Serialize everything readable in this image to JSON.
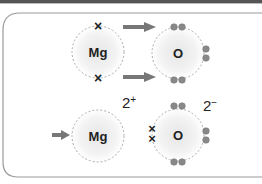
{
  "diagram": {
    "before": {
      "metal_atom": {
        "symbol": "Mg",
        "outer_electrons": 2,
        "electron_marker": "cross"
      },
      "nonmetal_atom": {
        "symbol": "O",
        "outer_electrons": 6,
        "electron_marker": "dot"
      },
      "arrows": 2
    },
    "after": {
      "metal_ion": {
        "symbol": "Mg",
        "charge": "2+",
        "outer_electrons": 0
      },
      "nonmetal_ion": {
        "symbol": "O",
        "charge": "2−",
        "outer_electrons": 8,
        "gained_marker": "cross",
        "gained": 2
      }
    },
    "colors": {
      "electron_dot": "#888888",
      "arrow": "#777777",
      "frame": "#999999",
      "shell": "#aaaaaa"
    }
  }
}
